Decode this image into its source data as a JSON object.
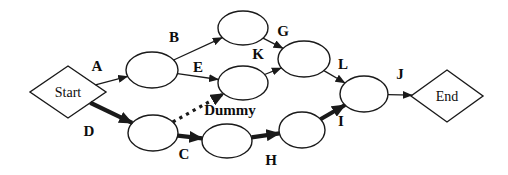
{
  "figure": {
    "type": "activity-on-arrow-network-diagram",
    "background_color": "#ffffff",
    "line_color": "#1a1a1a",
    "nodes": [
      {
        "id": "start",
        "shape": "diamond",
        "label": "Start",
        "cx": 68,
        "cy": 92,
        "w": 76,
        "h": 52
      },
      {
        "id": "n1",
        "shape": "ellipse",
        "label": "",
        "cx": 152,
        "cy": 70,
        "rx": 26,
        "ry": 18
      },
      {
        "id": "n2",
        "shape": "ellipse",
        "label": "",
        "cx": 243,
        "cy": 28,
        "rx": 25,
        "ry": 17
      },
      {
        "id": "n3",
        "shape": "ellipse",
        "label": "",
        "cx": 243,
        "cy": 83,
        "rx": 25,
        "ry": 17
      },
      {
        "id": "n4",
        "shape": "ellipse",
        "label": "",
        "cx": 304,
        "cy": 59,
        "rx": 26,
        "ry": 18
      },
      {
        "id": "n5",
        "shape": "ellipse",
        "label": "",
        "cx": 153,
        "cy": 133,
        "rx": 25,
        "ry": 18
      },
      {
        "id": "n6",
        "shape": "ellipse",
        "label": "",
        "cx": 227,
        "cy": 141,
        "rx": 25,
        "ry": 17
      },
      {
        "id": "n7",
        "shape": "ellipse",
        "label": "",
        "cx": 302,
        "cy": 130,
        "rx": 23,
        "ry": 18
      },
      {
        "id": "n8",
        "shape": "ellipse",
        "label": "",
        "cx": 364,
        "cy": 94,
        "rx": 24,
        "ry": 18
      },
      {
        "id": "end",
        "shape": "diamond",
        "label": "End",
        "cx": 447,
        "cy": 96,
        "w": 72,
        "h": 52
      }
    ],
    "edges": [
      {
        "label": "A",
        "from": "start",
        "to": "n1",
        "style": "thin",
        "lx": 97,
        "ly": 66
      },
      {
        "label": "B",
        "from": "n1",
        "to": "n2",
        "style": "thin",
        "lx": 174,
        "ly": 37
      },
      {
        "label": "E",
        "from": "n1",
        "to": "n3",
        "style": "thin",
        "lx": 198,
        "ly": 67
      },
      {
        "label": "D",
        "from": "start",
        "to": "n5",
        "style": "bold",
        "lx": 89,
        "ly": 131
      },
      {
        "label": "Dummy",
        "from": "n5",
        "to": "n3",
        "style": "dotted",
        "lx": 230,
        "ly": 110
      },
      {
        "label": "C",
        "from": "n5",
        "to": "n6",
        "style": "bold",
        "lx": 184,
        "ly": 154
      },
      {
        "label": "H",
        "from": "n6",
        "to": "n7",
        "style": "bold",
        "lx": 271,
        "ly": 160
      },
      {
        "label": "G",
        "from": "n2",
        "to": "n4",
        "style": "thin",
        "lx": 283,
        "ly": 31
      },
      {
        "label": "K",
        "from": "n3",
        "to": "n4",
        "style": "thin",
        "lx": 258,
        "ly": 54
      },
      {
        "label": "L",
        "from": "n4",
        "to": "n8",
        "style": "thin",
        "lx": 343,
        "ly": 64
      },
      {
        "label": "I",
        "from": "n7",
        "to": "n8",
        "style": "bold",
        "lx": 341,
        "ly": 121
      },
      {
        "label": "J",
        "from": "n8",
        "to": "end",
        "style": "thin",
        "lx": 400,
        "ly": 74
      }
    ]
  }
}
